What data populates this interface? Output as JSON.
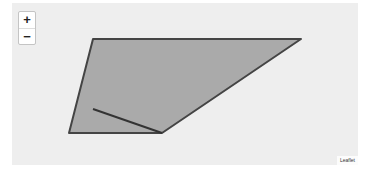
{
  "map": {
    "zoom_in_label": "+",
    "zoom_out_label": "−",
    "attribution": "Leaflet",
    "background_color": "#eeeeee",
    "polygon": {
      "fill_color": "#aaaaaa",
      "stroke_color": "#444444",
      "points_outer": "81,36 289,36 150,130 57,130",
      "inner_line": "81,106 150,130",
      "left_edge": "81,36 81,106"
    }
  }
}
